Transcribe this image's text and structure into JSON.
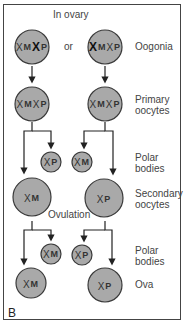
{
  "title": "In ovary",
  "connector_or": "or",
  "panel_letter": "B",
  "ovulation_label": "Ovulation",
  "colors": {
    "cell_fill": "#a9a9a9",
    "cell_stroke": "#3a3a3a",
    "line": "#222222",
    "frame": "#444444"
  },
  "stages": [
    {
      "label": "Oogonia"
    },
    {
      "label": "Primary\noocytes"
    },
    {
      "label": "Polar\nbodies"
    },
    {
      "label": "Secondary\noocytes"
    },
    {
      "label": "Polar\nbodies"
    },
    {
      "label": "Ova"
    }
  ],
  "cells": {
    "oogonia_left": {
      "x1": "X",
      "m": "M",
      "x2": "X",
      "p": "P",
      "bold": "paternal"
    },
    "oogonia_right": {
      "x1": "X",
      "m": "M",
      "x2": "X",
      "p": "P",
      "bold": "maternal"
    },
    "primary_left": {
      "x1": "X",
      "m": "M",
      "x2": "X",
      "p": "P"
    },
    "primary_right": {
      "x1": "X",
      "m": "M",
      "x2": "X",
      "p": "P"
    },
    "polar1_left": {
      "x": "X",
      "tag": "P"
    },
    "polar1_right": {
      "x": "X",
      "tag": "M"
    },
    "secondary_left": {
      "x": "X",
      "tag": "M"
    },
    "secondary_right": {
      "x": "X",
      "tag": "P"
    },
    "polar2_left": {
      "x": "X",
      "tag": "M"
    },
    "polar2_right": {
      "x": "X",
      "tag": "P"
    },
    "ovum_left": {
      "x": "X",
      "tag": "M"
    },
    "ovum_right": {
      "x": "X",
      "tag": "P"
    }
  }
}
